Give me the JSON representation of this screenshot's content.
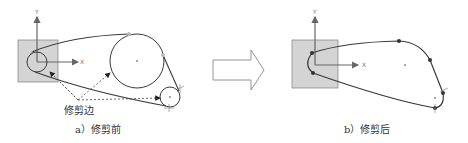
{
  "figure_a": {
    "caption": "a）修剪前",
    "trim_label": "修剪边",
    "axis_x": "X",
    "axis_y": "Y"
  },
  "figure_b": {
    "caption": "b）修剪后",
    "axis_x": "X",
    "axis_y": "Y"
  },
  "arrow": {
    "direction": "right"
  },
  "colors": {
    "stroke": "#3a3a3a",
    "square_fill": "#d4d4d4",
    "square_stroke": "#8a8a8a",
    "axis": "#666666",
    "arrow_stroke": "#888888"
  }
}
